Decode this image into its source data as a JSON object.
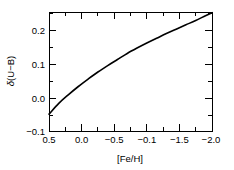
{
  "chart_data": {
    "type": "line",
    "title": "",
    "subtitle": "",
    "xlabel": "[Fe/H]",
    "ylabel": "δ(U−B)",
    "ylabel_symbol": "δ",
    "ylabel_rest": "(U−B)",
    "xlim": [
      0.5,
      -2.0
    ],
    "ylim": [
      -0.1,
      0.253
    ],
    "x_ticks": [
      0.5,
      0.0,
      -0.5,
      -0.1,
      -1.5,
      -2.0
    ],
    "x_tick_labels": [
      "0.5",
      "0.0",
      "−0.5",
      "−0.1",
      "−1.5",
      "−2.0"
    ],
    "y_ticks": [
      0.2,
      0.1,
      0.0,
      -0.1
    ],
    "y_tick_labels": [
      "0.2",
      "0.1",
      "0.0",
      "−0.1"
    ],
    "x_minor_per_interval": 1,
    "y_minor_per_interval": 1,
    "grid": false,
    "legend": null,
    "legend_position": "none",
    "ticks_direction": "in",
    "frame": "full-box",
    "series": [
      {
        "name": "ultraviolet excess",
        "color": "#000000",
        "x": [
          0.5,
          0.35,
          0.2,
          0.05,
          -0.1,
          -0.25,
          -0.4,
          -0.55,
          -0.7,
          -0.85,
          -1.0,
          -1.15,
          -1.3,
          -1.45,
          -1.6,
          -1.75,
          -1.9,
          -2.0
        ],
        "y": [
          -0.05,
          -0.018,
          0.008,
          0.032,
          0.054,
          0.075,
          0.094,
          0.112,
          0.13,
          0.146,
          0.161,
          0.175,
          0.189,
          0.202,
          0.215,
          0.228,
          0.242,
          0.251
        ]
      }
    ],
    "annotations": []
  },
  "figure": {
    "background_color": "#ffffff",
    "axis_color": "#000000"
  }
}
